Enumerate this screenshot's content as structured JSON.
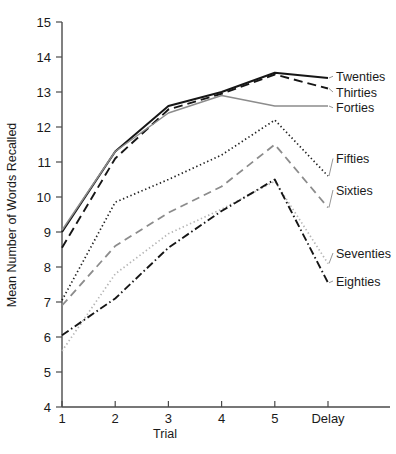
{
  "chart_data": {
    "type": "line",
    "title": "",
    "subtitle": "",
    "xlabel": "Trial",
    "ylabel": "Mean Number of Words Recalled",
    "categories": [
      "1",
      "2",
      "3",
      "4",
      "5",
      "Delay"
    ],
    "x_tick_labels": [
      "1",
      "2",
      "3",
      "4",
      "5",
      "Delay"
    ],
    "y_tick_labels": [
      "4",
      "5",
      "6",
      "7",
      "8",
      "9",
      "10",
      "11",
      "12",
      "13",
      "14",
      "15"
    ],
    "ylim": [
      4,
      15
    ],
    "xlim": [
      0,
      5
    ],
    "grid": false,
    "legend_position": "right-inline",
    "series": [
      {
        "name": "Twenties",
        "values": [
          9.0,
          11.3,
          12.6,
          13.0,
          13.55,
          13.4
        ],
        "style": "solid",
        "color": "#161616",
        "width": 2.0,
        "dash": "none",
        "label_y": 13.45
      },
      {
        "name": "Thirties",
        "values": [
          8.55,
          11.1,
          12.5,
          12.95,
          13.5,
          13.1
        ],
        "style": "dashed",
        "color": "#161616",
        "width": 1.9,
        "dash": "9,5",
        "label_y": 13.0
      },
      {
        "name": "Forties",
        "values": [
          9.05,
          11.3,
          12.4,
          12.9,
          12.6,
          12.6
        ],
        "style": "solid",
        "color": "#8c8c8c",
        "width": 1.5,
        "dash": "none",
        "label_y": 12.55
      },
      {
        "name": "Fifties",
        "values": [
          7.05,
          9.85,
          10.5,
          11.2,
          12.2,
          10.6
        ],
        "style": "dotted",
        "color": "#222222",
        "width": 1.7,
        "dash": "1.4,2.6",
        "label_y": 11.1
      },
      {
        "name": "Sixties",
        "values": [
          6.9,
          8.6,
          9.55,
          10.3,
          11.5,
          9.7
        ],
        "style": "dashed",
        "color": "#8c8c8c",
        "width": 1.8,
        "dash": "8,5",
        "label_y": 10.2
      },
      {
        "name": "Seventies",
        "values": [
          5.6,
          7.8,
          8.95,
          9.65,
          10.45,
          8.1
        ],
        "style": "dotted",
        "color": "#b5b5b5",
        "width": 1.7,
        "dash": "1.4,2.6",
        "label_y": 8.4
      },
      {
        "name": "Eighties",
        "values": [
          6.05,
          7.1,
          8.55,
          9.6,
          10.5,
          7.55
        ],
        "style": "dash-dot",
        "color": "#161616",
        "width": 1.9,
        "dash": "8,3,1.5,3",
        "label_y": 7.6
      }
    ]
  }
}
